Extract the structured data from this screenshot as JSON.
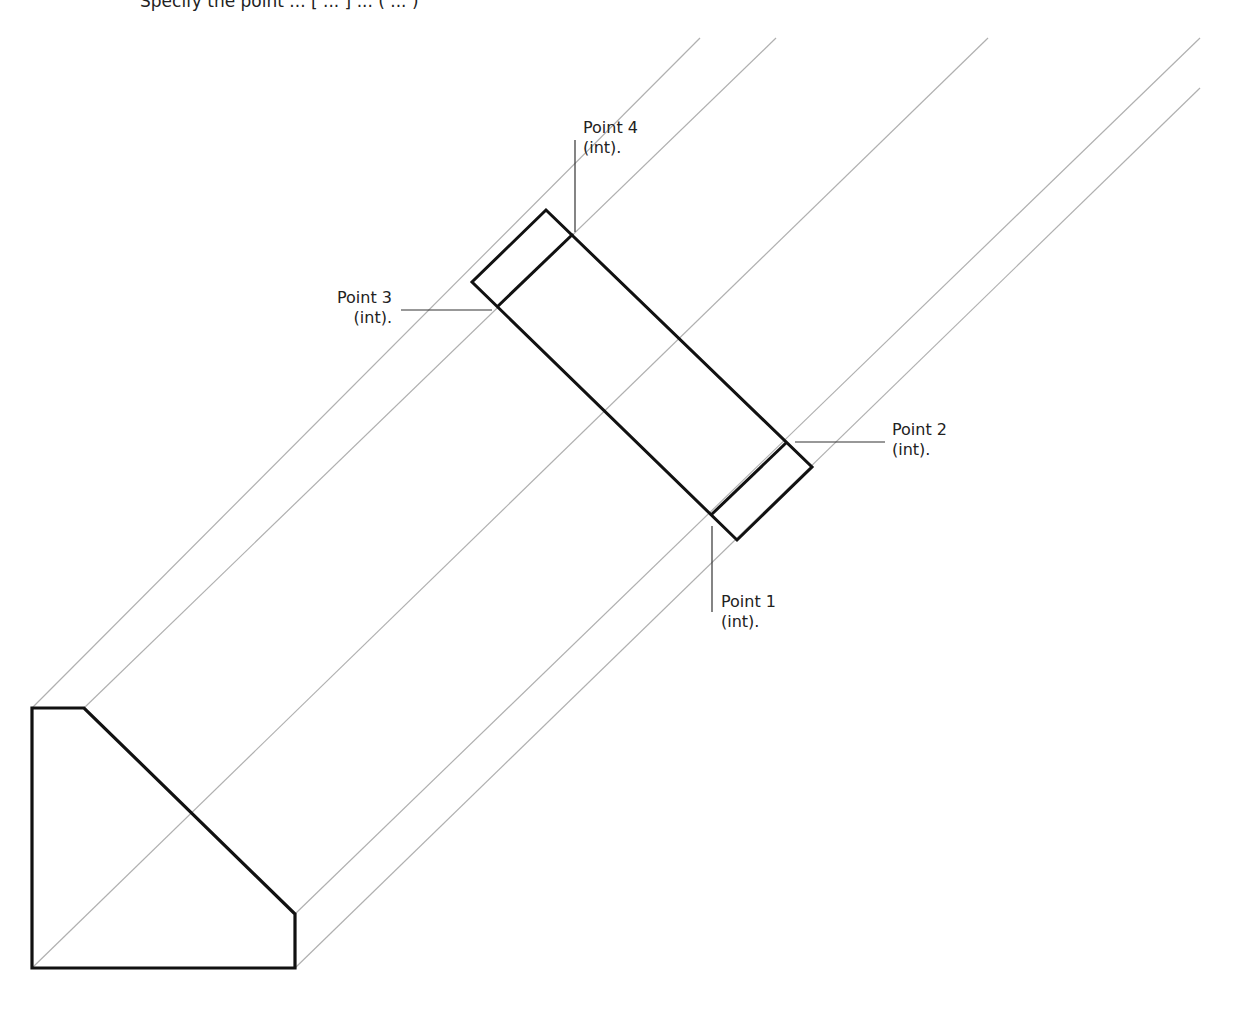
{
  "header": {
    "instruction_fragment": "Specify the point ... [ ... ] ... ( ... )"
  },
  "diagram": {
    "stroke_colors": {
      "outline": "#111111",
      "construction": "#b0b0b0",
      "leader": "#333333"
    },
    "labels": [
      {
        "id": "point4",
        "line1": "Point 4",
        "line2": "(int)."
      },
      {
        "id": "point3",
        "line1": "Point 3",
        "line2": "(int)."
      },
      {
        "id": "point2",
        "line1": "Point 2",
        "line2": "(int)."
      },
      {
        "id": "point1",
        "line1": "Point 1",
        "line2": "(int)."
      }
    ]
  }
}
